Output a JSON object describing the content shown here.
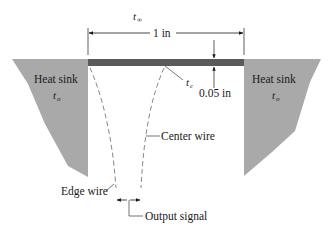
{
  "diagram": {
    "ambient_label": {
      "symbol": "t",
      "subscript": "∞"
    },
    "width_dimension": "1 in",
    "thickness_dimension": "0.05 in",
    "center_temp_label": {
      "symbol": "t",
      "subscript": "c"
    },
    "left_sink": {
      "title": "Heat sink",
      "temp_symbol": "t",
      "temp_subscript": "o"
    },
    "right_sink": {
      "title": "Heat sink",
      "temp_symbol": "t",
      "temp_subscript": "o"
    },
    "center_wire_label": "Center wire",
    "edge_wire_label": "Edge wire",
    "output_label": "Output signal",
    "colors": {
      "sink_fill": "#a9a9a9",
      "plate_fill": "#5a5a5a",
      "line": "#1a1a1a",
      "wire": "#7a7a7a"
    }
  }
}
